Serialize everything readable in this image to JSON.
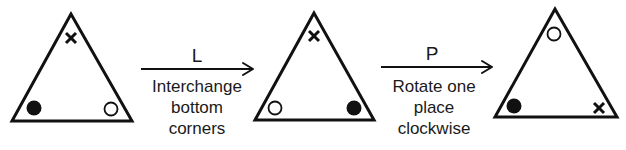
{
  "diagram": {
    "triangles": [
      {
        "name": "initial",
        "top": "cross",
        "bottom_left": "filled-circle",
        "bottom_right": "open-circle"
      },
      {
        "name": "after-L",
        "top": "cross",
        "bottom_left": "open-circle",
        "bottom_right": "filled-circle"
      },
      {
        "name": "after-P",
        "top": "open-circle",
        "bottom_left": "filled-circle",
        "bottom_right": "cross"
      }
    ],
    "transformations": [
      {
        "symbol": "L",
        "description_lines": [
          "Interchange",
          "bottom",
          "corners"
        ]
      },
      {
        "symbol": "P",
        "description_lines": [
          "Rotate one",
          "place",
          "clockwise"
        ]
      }
    ]
  }
}
